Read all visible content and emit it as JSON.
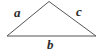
{
  "figure": {
    "name": "labeled-triangle",
    "canvas": {
      "width": 103,
      "height": 53,
      "background_color": "#ffffff"
    },
    "stroke": {
      "color": "#555555",
      "width": 1
    },
    "label_color": "#2b2b2b",
    "vertices": {
      "apex": {
        "x": 49,
        "y": 1.5
      },
      "bottom_left": {
        "x": 7,
        "y": 36
      },
      "bottom_right": {
        "x": 96,
        "y": 36
      }
    },
    "sides": [
      {
        "id": "side-a",
        "label": "a",
        "position": "upper-left",
        "from": "bottom_left",
        "to": "apex"
      },
      {
        "id": "side-c",
        "label": "c",
        "position": "upper-right",
        "from": "apex",
        "to": "bottom_right"
      },
      {
        "id": "side-b",
        "label": "b",
        "position": "bottom",
        "from": "bottom_left",
        "to": "bottom_right"
      }
    ]
  }
}
